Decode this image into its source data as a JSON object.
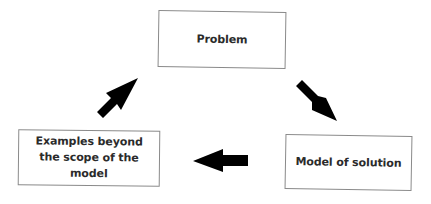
{
  "diagram": {
    "type": "cycle",
    "nodes": [
      {
        "id": "problem",
        "label": "Problem"
      },
      {
        "id": "model",
        "label": "Model of solution"
      },
      {
        "id": "examples",
        "label": "Examples beyond the scope of the model"
      }
    ],
    "edges": [
      {
        "from": "problem",
        "to": "model",
        "direction": "down-right"
      },
      {
        "from": "model",
        "to": "examples",
        "direction": "left"
      },
      {
        "from": "examples",
        "to": "problem",
        "direction": "up-right"
      }
    ],
    "colors": {
      "box_border": "#8a8a8a",
      "text": "#2b2b2b",
      "arrow": "#000000",
      "background": "#ffffff"
    }
  }
}
